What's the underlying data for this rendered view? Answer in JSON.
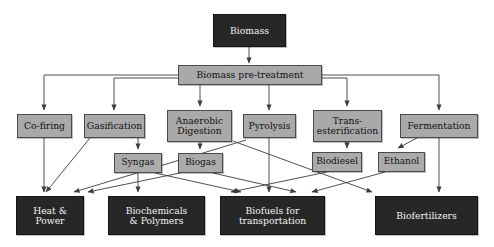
{
  "diagram": {
    "colors": {
      "process_fill": "#a9a9a9",
      "process_border": "#4a4a4a",
      "product_fill": "#272727",
      "product_text": "#f2f2f2",
      "arrow": "#3c3c3c",
      "background": "#ffffff"
    },
    "nodes": {
      "source": {
        "label": "Biomass",
        "type": "product",
        "x": 213,
        "y": 14,
        "w": 73,
        "h": 33
      },
      "pretreatment": {
        "label": "Biomass pre-treatment",
        "type": "process",
        "x": 178,
        "y": 65,
        "w": 144,
        "h": 20
      },
      "processes": [
        {
          "id": "co_firing",
          "label": "Co-firing",
          "x": 17,
          "y": 114,
          "w": 55,
          "h": 24
        },
        {
          "id": "gasification",
          "label": "Gasification",
          "x": 84,
          "y": 114,
          "w": 61,
          "h": 24
        },
        {
          "id": "anaerobic",
          "label": "Anaerobic\nDigestion",
          "x": 167,
          "y": 110,
          "w": 65,
          "h": 32
        },
        {
          "id": "pyrolysis",
          "label": "Pyrolysis",
          "x": 243,
          "y": 114,
          "w": 53,
          "h": 24
        },
        {
          "id": "transesterification",
          "label": "Trans-\nesterification",
          "x": 313,
          "y": 110,
          "w": 69,
          "h": 32
        },
        {
          "id": "fermentation",
          "label": "Fermentation",
          "x": 400,
          "y": 114,
          "w": 78,
          "h": 24
        }
      ],
      "intermediates": [
        {
          "id": "syngas",
          "label": "Syngas",
          "x": 114,
          "y": 153,
          "w": 48,
          "h": 20
        },
        {
          "id": "biogas",
          "label": "Biogas",
          "x": 178,
          "y": 153,
          "w": 45,
          "h": 20
        },
        {
          "id": "biodiesel",
          "label": "Biodiesel",
          "x": 312,
          "y": 152,
          "w": 50,
          "h": 20
        },
        {
          "id": "ethanol",
          "label": "Ethanol",
          "x": 378,
          "y": 152,
          "w": 47,
          "h": 20
        }
      ],
      "products": [
        {
          "id": "heat_power",
          "label": "Heat &\nPower",
          "x": 16,
          "y": 196,
          "w": 68,
          "h": 39
        },
        {
          "id": "biochemicals",
          "label": "Biochemicals\n& Polymers",
          "x": 108,
          "y": 196,
          "w": 97,
          "h": 39
        },
        {
          "id": "biofuels",
          "label": "Biofuels for\ntransportation",
          "x": 220,
          "y": 196,
          "w": 105,
          "h": 39
        },
        {
          "id": "biofertilizers",
          "label": "Biofertilizers",
          "x": 375,
          "y": 196,
          "w": 103,
          "h": 39
        }
      ]
    },
    "edges": [
      {
        "from": "source",
        "to": "pretreatment"
      },
      {
        "from": "pretreatment",
        "to": "co_firing"
      },
      {
        "from": "pretreatment",
        "to": "gasification"
      },
      {
        "from": "pretreatment",
        "to": "anaerobic"
      },
      {
        "from": "pretreatment",
        "to": "pyrolysis"
      },
      {
        "from": "pretreatment",
        "to": "transesterification"
      },
      {
        "from": "pretreatment",
        "to": "fermentation"
      },
      {
        "from": "co_firing",
        "to": "heat_power"
      },
      {
        "from": "gasification",
        "to": "syngas"
      },
      {
        "from": "gasification",
        "to": "heat_power"
      },
      {
        "from": "anaerobic",
        "to": "biogas"
      },
      {
        "from": "pyrolysis",
        "to": "biofuels"
      },
      {
        "from": "pyrolysis",
        "to": "heat_power"
      },
      {
        "from": "syngas",
        "to": "biochemicals"
      },
      {
        "from": "syngas",
        "to": "biofuels"
      },
      {
        "from": "biogas",
        "to": "heat_power"
      },
      {
        "from": "biogas",
        "to": "biofuels"
      },
      {
        "from": "transesterification",
        "to": "biodiesel"
      },
      {
        "from": "biodiesel",
        "to": "biofuels"
      },
      {
        "from": "fermentation",
        "to": "ethanol"
      },
      {
        "from": "fermentation",
        "to": "biofertilizers"
      },
      {
        "from": "ethanol",
        "to": "biofuels"
      },
      {
        "from": "anaerobic",
        "to": "biofertilizers"
      }
    ]
  }
}
